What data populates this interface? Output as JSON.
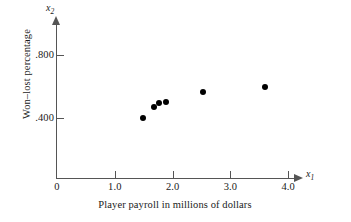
{
  "chart_data": {
    "type": "scatter",
    "title": "",
    "xlabel": "Player payroll in millions of dollars",
    "ylabel": "Won–lost percentage",
    "x_var_name": "x",
    "x_var_sub": "1",
    "y_var_name": "x",
    "y_var_sub": "2",
    "xlim": [
      0,
      4.2
    ],
    "ylim": [
      0,
      1.0
    ],
    "xticks": [
      {
        "value": 0,
        "label": "0"
      },
      {
        "value": 1.0,
        "label": "1.0"
      },
      {
        "value": 2.0,
        "label": "2.0"
      },
      {
        "value": 3.0,
        "label": "3.0"
      },
      {
        "value": 4.0,
        "label": "4.0"
      }
    ],
    "yticks": [
      {
        "value": 0.8,
        "label": ".800"
      },
      {
        "value": 0.4,
        "label": ".400"
      }
    ],
    "grid": false,
    "legend": false,
    "marker_color": "#000000",
    "axis_color": "#555555",
    "points": [
      {
        "x": 1.49,
        "y": 0.4
      },
      {
        "x": 1.67,
        "y": 0.47
      },
      {
        "x": 1.77,
        "y": 0.495
      },
      {
        "x": 1.88,
        "y": 0.502
      },
      {
        "x": 2.52,
        "y": 0.566
      },
      {
        "x": 3.59,
        "y": 0.598
      }
    ]
  }
}
